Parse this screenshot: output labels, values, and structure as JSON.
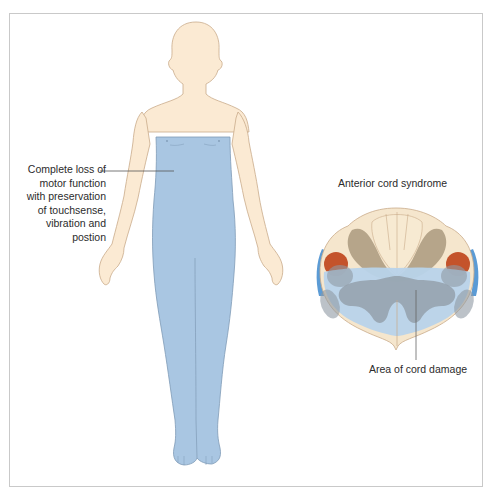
{
  "figure": {
    "left_annotation": {
      "lines": [
        "Complete loss of",
        "motor function",
        "with preservation",
        "of touchsense,",
        "vibration and",
        "postion"
      ]
    },
    "cross_section": {
      "title": "Anterior cord syndrome",
      "damage_label": "Area of cord damage"
    },
    "colors": {
      "skin": "#fbead3",
      "skin_outline": "#c9ab8a",
      "affected_blue": "#a9c6e2",
      "affected_outline": "#7f9bb6",
      "gray_matter": "#8f9aa3",
      "dorsal_tract": "#b6a58a",
      "spinothalamic_red": "#c4532b",
      "edge_blue": "#5b9bd5",
      "frame_border": "#c9c9c9",
      "text": "#2b2b2b"
    }
  }
}
